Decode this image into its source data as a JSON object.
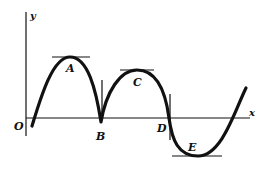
{
  "diagram": {
    "axes": {
      "x_label": "x",
      "y_label": "y",
      "origin_label": "O"
    },
    "points": [
      {
        "id": "A",
        "label": "A",
        "type": "local maximum",
        "tangent": "horizontal"
      },
      {
        "id": "B",
        "label": "B",
        "type": "cusp (local minimum on x-axis)",
        "tangent": "vertical"
      },
      {
        "id": "C",
        "label": "C",
        "type": "local maximum",
        "tangent": "horizontal"
      },
      {
        "id": "D",
        "label": "D",
        "type": "inflection point on x-axis",
        "tangent": "vertical"
      },
      {
        "id": "E",
        "label": "E",
        "type": "local minimum",
        "tangent": "horizontal"
      }
    ],
    "colors": {
      "stroke": "#111111",
      "background": "#ffffff"
    }
  }
}
